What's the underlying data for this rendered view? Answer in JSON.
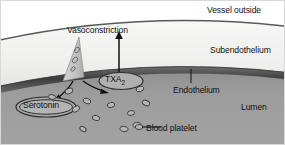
{
  "figure": {
    "labels": {
      "vessel_outside": "Vessel outside",
      "subendothelium": "Subendothelium",
      "endothelium": "Endothelium",
      "lumen": "Lumen",
      "vasoconstriction": "Vasoconstriction",
      "blood_platelet": "Blood platelet",
      "txa2": "TXA",
      "txa2_sub": "2",
      "serotonin": "Serotonin"
    },
    "colors": {
      "background": "#ffffff",
      "subendothelium_fill": "#f0f0ee",
      "endothelium_band": "#4a4a4a",
      "lumen_fill": "#9a9a9a",
      "platelet_fill": "#b6b6b6",
      "platelet_stroke": "#3c3c3c",
      "wedge_fill": "#c9c9c9",
      "arrow": "#111111",
      "text": "#111111"
    },
    "platelets": [
      {
        "cx": 68,
        "cy": 90,
        "rx": 4.0,
        "ry": 2.6,
        "rot": -25
      },
      {
        "cx": 86,
        "cy": 100,
        "rx": 4.0,
        "ry": 2.6,
        "rot": 20
      },
      {
        "cx": 51,
        "cy": 96,
        "rx": 3.6,
        "ry": 2.4,
        "rot": 10
      },
      {
        "cx": 75,
        "cy": 108,
        "rx": 4.0,
        "ry": 2.6,
        "rot": -35
      },
      {
        "cx": 95,
        "cy": 117,
        "rx": 3.8,
        "ry": 2.5,
        "rot": 15
      },
      {
        "cx": 110,
        "cy": 104,
        "rx": 3.8,
        "ry": 2.5,
        "rot": -15
      },
      {
        "cx": 123,
        "cy": 128,
        "rx": 4.0,
        "ry": 2.6,
        "rot": 8
      },
      {
        "cx": 139,
        "cy": 88,
        "rx": 4.0,
        "ry": 2.6,
        "rot": -20
      },
      {
        "cx": 145,
        "cy": 102,
        "rx": 3.8,
        "ry": 2.5,
        "rot": 25
      },
      {
        "cx": 130,
        "cy": 112,
        "rx": 3.6,
        "ry": 2.4,
        "rot": -10
      },
      {
        "cx": 82,
        "cy": 128,
        "rx": 3.4,
        "ry": 2.2,
        "rot": 30
      },
      {
        "cx": 136,
        "cy": 124,
        "rx": 4.0,
        "ry": 2.6,
        "rot": -5
      }
    ],
    "granules": [
      {
        "cx": 75,
        "cy": 48,
        "rx": 3.0,
        "ry": 2.0,
        "rot": -55
      },
      {
        "cx": 72,
        "cy": 58,
        "rx": 3.2,
        "ry": 2.2,
        "rot": -50
      },
      {
        "cx": 70,
        "cy": 67,
        "rx": 2.6,
        "ry": 1.8,
        "rot": -45
      }
    ],
    "callout_platelet": {
      "cx": 138,
      "cy": 126,
      "rx": 3.8,
      "ry": 2.5
    }
  }
}
